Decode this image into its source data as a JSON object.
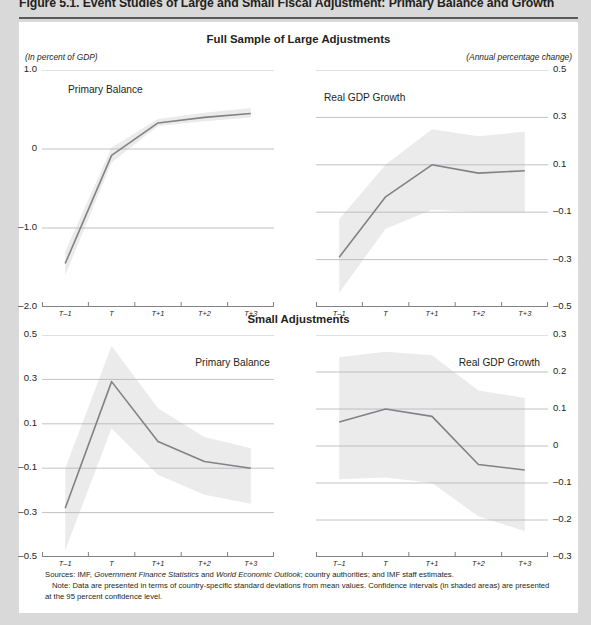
{
  "figure": {
    "title": "Figure 5.1.  Event Studies of Large and Small Fiscal Adjustment: Primary Balance and Growth",
    "sections": [
      {
        "heading": "Full Sample of Large Adjustments"
      },
      {
        "heading": "Small Adjustments"
      }
    ],
    "unit_notes": {
      "left": "(In percent of GDP)",
      "right": "(Annual percentage change)"
    },
    "footnotes": {
      "sources_label": "Sources:",
      "sources_text_1": "IMF,",
      "sources_italic_1": "Government Finance Statistics",
      "sources_text_2": "and",
      "sources_italic_2": "World Economic Outlook",
      "sources_text_3": "; country authorities; and IMF staff estimates.",
      "note_label": "Note:",
      "note_text": "Data are presented in terms of country-specific standard deviations from mean values. Confidence intervals (in shaded areas) are presented at the 95 percent confidence level."
    },
    "colors": {
      "line": "#808285",
      "band": "#ebebeb",
      "grid": "#b1b3b5",
      "axis": "#808285",
      "text": "#231f20",
      "page_bg": "#d9d9d9",
      "panel_bg": "#ffffff",
      "rule": "#58595b"
    }
  },
  "chart_data": [
    {
      "id": "large-primary-balance",
      "type": "line",
      "title": "Primary Balance",
      "panel": "top-left",
      "xlabel": "",
      "ylabel": "",
      "unit": "(In percent of GDP)",
      "axis_side": "left",
      "grid": true,
      "categories": [
        "T–1",
        "T",
        "T+1",
        "T+2",
        "T+3"
      ],
      "ylim": [
        -2.0,
        1.0
      ],
      "yticks": [
        1.0,
        0,
        -1.0,
        -2.0
      ],
      "ytick_labels": [
        "1.0",
        "0",
        "–1.0",
        "–2.0"
      ],
      "series": [
        {
          "name": "Primary Balance",
          "values": [
            -1.45,
            -0.08,
            0.33,
            0.4,
            0.45
          ]
        }
      ],
      "confidence_band": {
        "label": "95 percent confidence interval",
        "lower": [
          -1.6,
          -0.17,
          0.29,
          0.35,
          0.4
        ],
        "upper": [
          -1.3,
          0.02,
          0.38,
          0.46,
          0.52
        ]
      }
    },
    {
      "id": "large-real-gdp-growth",
      "type": "line",
      "title": "Real GDP Growth",
      "panel": "top-right",
      "xlabel": "",
      "ylabel": "",
      "unit": "(Annual percentage change)",
      "axis_side": "right",
      "grid": true,
      "categories": [
        "T–1",
        "T",
        "T+1",
        "T+2",
        "T+3"
      ],
      "ylim": [
        -0.5,
        0.5
      ],
      "yticks": [
        0.5,
        0.3,
        0.1,
        -0.1,
        -0.3,
        -0.5
      ],
      "ytick_labels": [
        "0.5",
        "0.3",
        "0.1",
        "–0.1",
        "–0.3",
        "–0.5"
      ],
      "series": [
        {
          "name": "Real GDP Growth",
          "values": [
            -0.29,
            -0.035,
            0.1,
            0.065,
            0.075
          ]
        }
      ],
      "confidence_band": {
        "label": "95 percent confidence interval",
        "lower": [
          -0.44,
          -0.17,
          -0.09,
          -0.1,
          -0.1
        ],
        "upper": [
          -0.13,
          0.1,
          0.25,
          0.22,
          0.24
        ]
      }
    },
    {
      "id": "small-primary-balance",
      "type": "line",
      "title": "Primary Balance",
      "panel": "bottom-left",
      "xlabel": "",
      "ylabel": "",
      "unit": "(In percent of GDP)",
      "axis_side": "left",
      "grid": true,
      "categories": [
        "T–1",
        "T",
        "T+1",
        "T+2",
        "T+3"
      ],
      "ylim": [
        -0.5,
        0.5
      ],
      "yticks": [
        0.5,
        0.3,
        0.1,
        -0.1,
        -0.3,
        -0.5
      ],
      "ytick_labels": [
        "0.5",
        "0.3",
        "0.1",
        "–0.1",
        "–0.3",
        "–0.5"
      ],
      "series": [
        {
          "name": "Primary Balance",
          "values": [
            -0.28,
            0.29,
            0.02,
            -0.07,
            -0.1
          ]
        }
      ],
      "confidence_band": {
        "label": "95 percent confidence interval",
        "lower": [
          -0.47,
          0.08,
          -0.13,
          -0.22,
          -0.26
        ],
        "upper": [
          -0.1,
          0.45,
          0.17,
          0.04,
          -0.01
        ]
      }
    },
    {
      "id": "small-real-gdp-growth",
      "type": "line",
      "title": "Real GDP Growth",
      "panel": "bottom-right",
      "xlabel": "",
      "ylabel": "",
      "unit": "(Annual percentage change)",
      "axis_side": "right",
      "grid": true,
      "categories": [
        "T–1",
        "T",
        "T+1",
        "T+2",
        "T+3"
      ],
      "ylim": [
        -0.3,
        0.3
      ],
      "yticks": [
        0.3,
        0.2,
        0.1,
        0,
        -0.1,
        -0.2,
        -0.3
      ],
      "ytick_labels": [
        "0.3",
        "0.2",
        "0.1",
        "0",
        "–0.1",
        "–0.2",
        "–0.3"
      ],
      "series": [
        {
          "name": "Real GDP Growth",
          "values": [
            0.065,
            0.1,
            0.08,
            -0.05,
            -0.065
          ]
        }
      ],
      "confidence_band": {
        "label": "95 percent confidence interval",
        "lower": [
          -0.09,
          -0.085,
          -0.1,
          -0.19,
          -0.23
        ],
        "upper": [
          0.24,
          0.255,
          0.245,
          0.15,
          0.13
        ]
      }
    }
  ]
}
